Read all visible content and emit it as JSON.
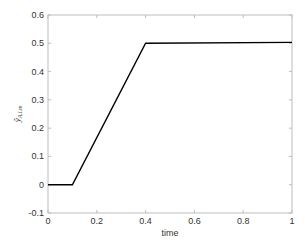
{
  "chart_data": {
    "type": "line",
    "title": "",
    "xlabel": "time",
    "ylabel": "ŷ",
    "ylabel_subscript": "A,l,m",
    "xlim": [
      0,
      1
    ],
    "ylim": [
      -0.1,
      0.6
    ],
    "xticks": [
      0,
      0.2,
      0.4,
      0.6,
      0.8,
      1
    ],
    "xtick_labels": [
      "0",
      "0.2",
      "0.4",
      "0.6",
      "0.8",
      "1"
    ],
    "yticks": [
      -0.1,
      0,
      0.1,
      0.2,
      0.3,
      0.4,
      0.5,
      0.6
    ],
    "ytick_labels": [
      "-0.1",
      "0",
      "0.1",
      "0.2",
      "0.3",
      "0.4",
      "0.5",
      "0.6"
    ],
    "grid": false,
    "legend": null,
    "series": [
      {
        "name": "y_hat_A_l_m",
        "color": "#000000",
        "x": [
          0,
          0.1,
          0.4,
          1.0
        ],
        "y": [
          0,
          0,
          0.5,
          0.503
        ]
      }
    ]
  }
}
